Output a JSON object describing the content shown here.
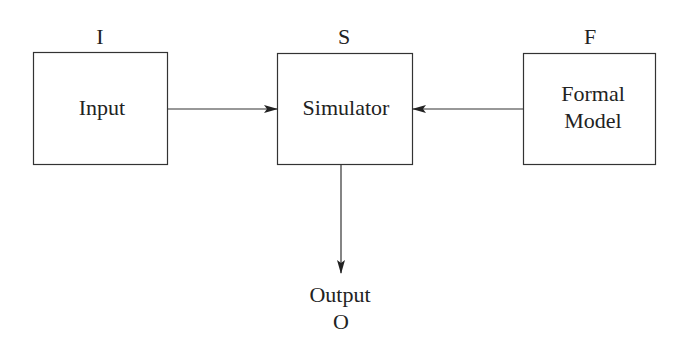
{
  "diagram": {
    "colors": {
      "stroke": "#333333",
      "text": "#222222",
      "background": "#ffffff"
    },
    "nodes": [
      {
        "id": "input",
        "letter": "I",
        "label_lines": [
          "Input"
        ],
        "box": {
          "x": 33,
          "y": 52,
          "w": 134,
          "h": 113
        }
      },
      {
        "id": "simulator",
        "letter": "S",
        "label_lines": [
          "Simulator"
        ],
        "box": {
          "x": 277,
          "y": 53,
          "w": 135,
          "h": 112
        }
      },
      {
        "id": "formal-model",
        "letter": "F",
        "label_lines": [
          "Formal",
          "Model"
        ],
        "box": {
          "x": 523,
          "y": 53,
          "w": 132,
          "h": 112
        }
      }
    ],
    "output": {
      "label": "Output",
      "letter": "O"
    },
    "edges": [
      {
        "from": "input",
        "to": "simulator",
        "direction": "right"
      },
      {
        "from": "formal-model",
        "to": "simulator",
        "direction": "left"
      },
      {
        "from": "simulator",
        "to": "output",
        "direction": "down"
      }
    ]
  }
}
